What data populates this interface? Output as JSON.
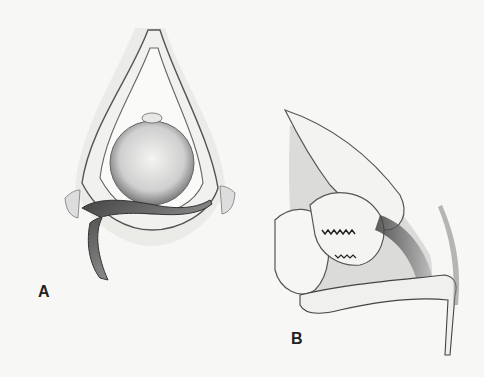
{
  "figure": {
    "panels": [
      {
        "id": "A",
        "label": "A",
        "description": "Frontal view illustration"
      },
      {
        "id": "B",
        "label": "B",
        "description": "Sagittal cross-section illustration"
      }
    ],
    "colors": {
      "background": "#f7f7f5",
      "ink": "#222222",
      "shade_dark": "#555555",
      "shade_mid": "#999999",
      "shade_light": "#e6e6e6"
    }
  }
}
